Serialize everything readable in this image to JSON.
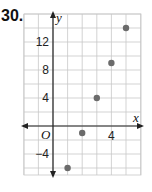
{
  "problem": {
    "number": "30."
  },
  "chart_data": {
    "type": "scatter",
    "title": "",
    "xlabel": "x",
    "ylabel": "y",
    "origin_label": "O",
    "x": [
      1,
      2,
      3,
      4,
      5
    ],
    "y": [
      -6,
      -1,
      4,
      9,
      14
    ],
    "series": [
      {
        "name": "points",
        "x": [
          1,
          2,
          3,
          4,
          5
        ],
        "y": [
          -6,
          -1,
          4,
          9,
          14
        ]
      }
    ],
    "xlim": [
      -2,
      6
    ],
    "ylim": [
      -8,
      16
    ],
    "x_grid_step": 1,
    "y_grid_step": 2,
    "x_tick_labels": [
      {
        "value": 4,
        "label": "4"
      }
    ],
    "y_tick_labels": [
      {
        "value": 12,
        "label": "12"
      },
      {
        "value": 8,
        "label": "8"
      },
      {
        "value": 4,
        "label": "4"
      },
      {
        "value": -4,
        "label": "−4"
      }
    ],
    "grid": true,
    "legend": "none",
    "point_color": "#6b6b6b",
    "grid_color": "#c8c8c8",
    "axis_color": "#222222"
  }
}
